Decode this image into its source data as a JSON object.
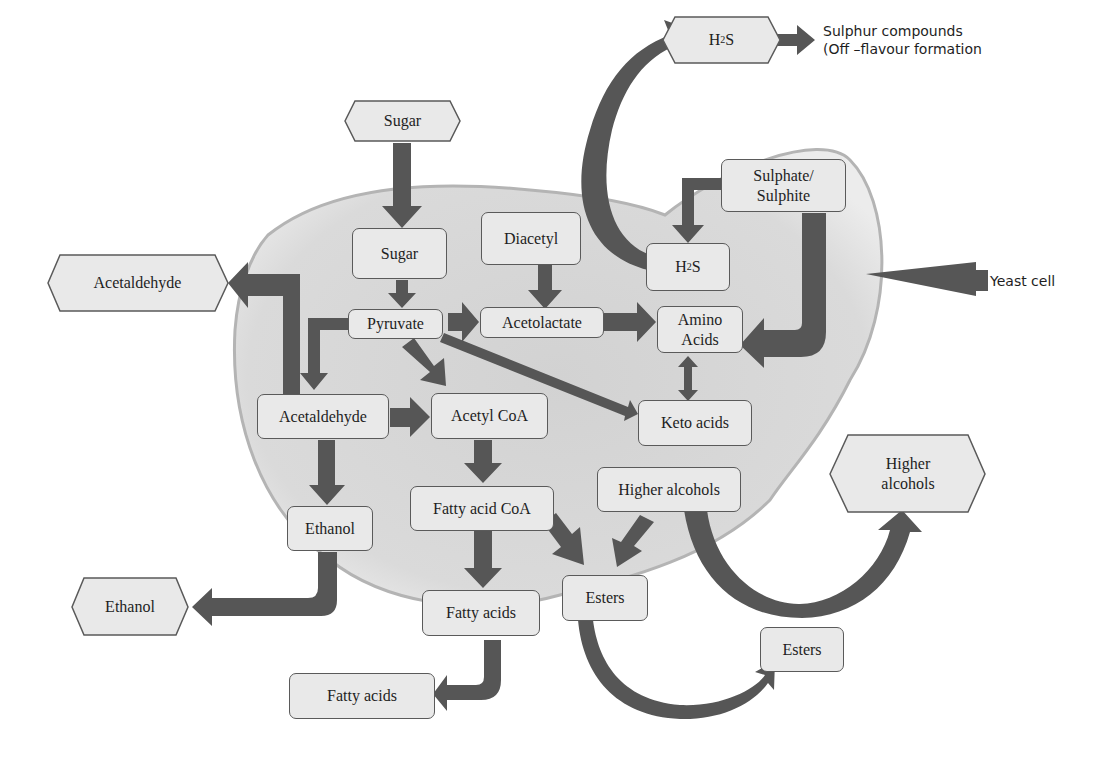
{
  "diagram": {
    "colors": {
      "arrow": "#565656",
      "box_fill": "#e9e9e9",
      "box_border": "#5a5a5a",
      "cell_fill": "#d6d6d6",
      "cell_border": "#b0b0b0"
    },
    "external_nodes": {
      "sugar_in": "Sugar",
      "h2s_out_main": "H",
      "h2s_out_sub": "2",
      "h2s_out_tail": "S",
      "acetaldehyde_out": "Acetaldehyde",
      "ethanol_out": "Ethanol",
      "fatty_acids_out": "Fatty acids",
      "esters_out": "Esters",
      "higher_alcohols_out": "Higher alcohols"
    },
    "internal_nodes": {
      "sugar": "Sugar",
      "diacetyl": "Diacetyl",
      "h2s_main": "H",
      "h2s_sub": "2",
      "h2s_tail": "S",
      "sulphate": "Sulphate/ Sulphite",
      "pyruvate": "Pyruvate",
      "acetolactate": "Acetolactate",
      "amino_acids": "Amino Acids",
      "acetaldehyde": "Acetaldehyde",
      "acetyl_coa": "Acetyl CoA",
      "keto_acids": "Keto acids",
      "higher_alcohols": "Higher alcohols",
      "fatty_acid_coa": "Fatty acid CoA",
      "ethanol": "Ethanol",
      "fatty_acids": "Fatty acids",
      "esters": "Esters"
    },
    "annotations": {
      "sulphur_line1": "Sulphur compounds",
      "sulphur_line2": "(Off –flavour formation",
      "yeast_cell": "Yeast cell"
    },
    "edges": [
      [
        "Sugar (ext)",
        "Sugar"
      ],
      [
        "Sugar",
        "Pyruvate"
      ],
      [
        "Pyruvate",
        "Acetolactate"
      ],
      [
        "Pyruvate",
        "Acetaldehyde"
      ],
      [
        "Pyruvate",
        "Acetyl CoA"
      ],
      [
        "Pyruvate",
        "Keto acids"
      ],
      [
        "Diacetyl",
        "Acetolactate"
      ],
      [
        "Acetolactate",
        "Amino Acids"
      ],
      [
        "Sulphate/Sulphite",
        "H2S"
      ],
      [
        "Sulphate/Sulphite",
        "Amino Acids"
      ],
      [
        "H2S",
        "H2S (ext)"
      ],
      [
        "H2S (ext)",
        "Sulphur compounds"
      ],
      [
        "Amino Acids",
        "Keto acids"
      ],
      [
        "Acetaldehyde",
        "Acetaldehyde (ext)"
      ],
      [
        "Acetaldehyde",
        "Acetyl CoA"
      ],
      [
        "Acetaldehyde",
        "Ethanol"
      ],
      [
        "Ethanol",
        "Ethanol (ext)"
      ],
      [
        "Acetyl CoA",
        "Fatty acid CoA"
      ],
      [
        "Fatty acid CoA",
        "Fatty acids"
      ],
      [
        "Fatty acid CoA",
        "Esters"
      ],
      [
        "Higher alcohols",
        "Esters"
      ],
      [
        "Higher alcohols",
        "Higher alcohols (ext)"
      ],
      [
        "Fatty acids",
        "Fatty acids (ext)"
      ],
      [
        "Esters",
        "Esters (ext)"
      ]
    ]
  }
}
